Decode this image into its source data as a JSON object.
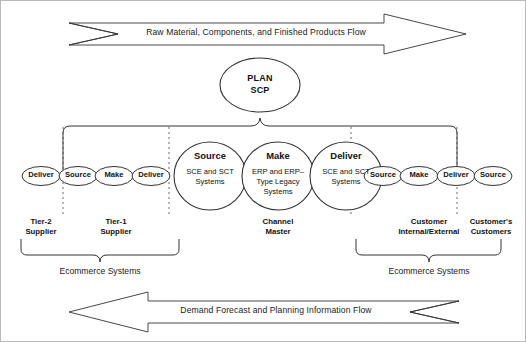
{
  "diagram": {
    "title_top_flow": "Raw Material, Components, and Finished Products Flow",
    "title_bottom_flow": "Demand Forecast and Planning Information Flow",
    "plan": {
      "line1": "PLAN",
      "line2": "SCP"
    },
    "left_chain": [
      {
        "label": "Deliver"
      },
      {
        "label": "Source"
      },
      {
        "label": "Make"
      },
      {
        "label": "Deliver"
      }
    ],
    "center_processes": [
      {
        "title": "Source",
        "sub_line1": "SCE and SCT",
        "sub_line2": "Systems",
        "sub_line3": ""
      },
      {
        "title": "Make",
        "sub_line1": "ERP and ERP–",
        "sub_line2": "Type Legacy",
        "sub_line3": "Systems"
      },
      {
        "title": "Deliver",
        "sub_line1": "SCE and SCT",
        "sub_line2": "Systems",
        "sub_line3": ""
      }
    ],
    "right_chain": [
      {
        "label": "Source"
      },
      {
        "label": "Make"
      },
      {
        "label": "Deliver"
      },
      {
        "label": "Source"
      }
    ],
    "actors": [
      {
        "line1": "Tier-2",
        "line2": "Supplier"
      },
      {
        "line1": "Tier-1",
        "line2": "Supplier"
      },
      {
        "line1": "Channel",
        "line2": "Master"
      },
      {
        "line1": "Customer",
        "line2": "Internal/External"
      },
      {
        "line1": "Customer's",
        "line2": "Customers"
      }
    ],
    "ecommerce_braces": [
      {
        "label": "Ecommerce Systems"
      },
      {
        "label": "Ecommerce Systems"
      }
    ],
    "colors": {
      "stroke": "#333333",
      "frame": "#b9b9b9",
      "text": "#111111",
      "background": "#ffffff"
    }
  }
}
